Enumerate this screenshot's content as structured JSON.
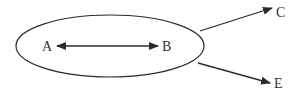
{
  "diagram": {
    "type": "relationship-diagram",
    "colors": {
      "stroke": "#2a2a2a",
      "text": "#333333",
      "background": "#ffffff"
    },
    "group": {
      "shape": "ellipse",
      "members": [
        "A",
        "B"
      ]
    },
    "nodes": [
      {
        "id": "A",
        "label": "A"
      },
      {
        "id": "B",
        "label": "B"
      },
      {
        "id": "C",
        "label": "C"
      },
      {
        "id": "E",
        "label": "E"
      }
    ],
    "edges": [
      {
        "from": "A",
        "to": "B",
        "direction": "bidirectional"
      },
      {
        "from": "group",
        "to": "C",
        "direction": "forward"
      },
      {
        "from": "group",
        "to": "E",
        "direction": "forward"
      }
    ]
  }
}
